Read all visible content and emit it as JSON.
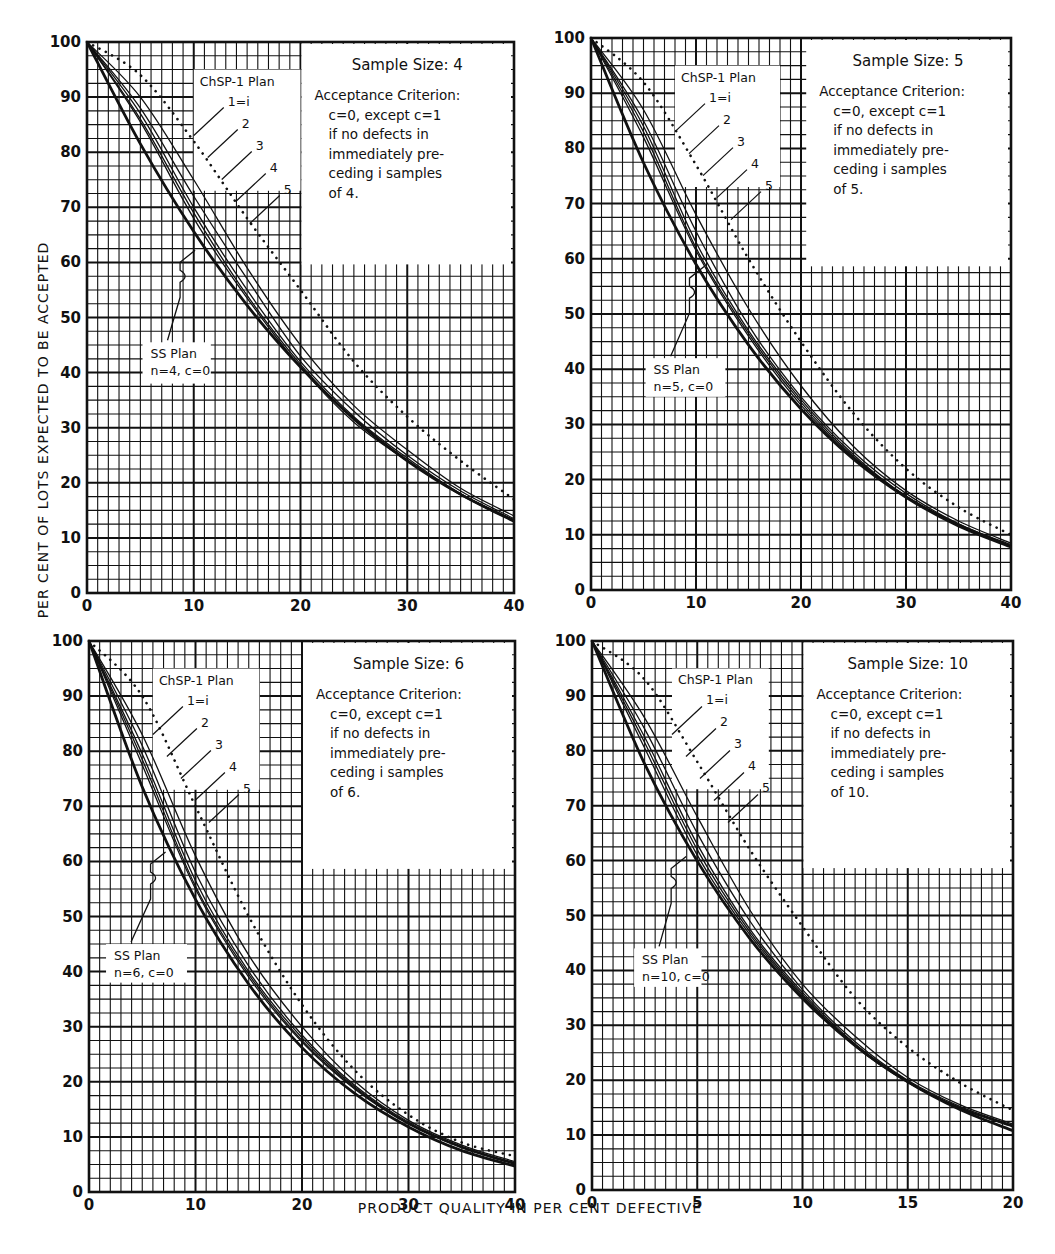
{
  "figure": {
    "ylabel": "PER CENT OF LOTS EXPECTED TO BE ACCEPTED",
    "xlabel": "PRODUCT QUALITY IN PER CENT DEFECTIVE",
    "colors": {
      "ink": "#111111",
      "paper": "#ffffff",
      "grid": "#1a1a1a"
    }
  },
  "chart_data": [
    {
      "type": "line",
      "title": "Sample Size: 4",
      "annotation_lines": [
        "Acceptance Criterion:",
        "c=0, except c=1",
        "if no defects in",
        "immediately pre-",
        "ceding i samples",
        "of 4."
      ],
      "legend_title": "ChSP-1 Plan",
      "legend_labels": [
        "1=i",
        "2",
        "3",
        "4",
        "5"
      ],
      "ss_label": [
        "SS Plan",
        "n=4, c=0"
      ],
      "xlabel": "PRODUCT QUALITY IN PER CENT DEFECTIVE",
      "ylabel": "PER CENT OF LOTS EXPECTED TO BE ACCEPTED",
      "xlim": [
        0,
        40
      ],
      "ylim": [
        0,
        100
      ],
      "xticks": [
        0,
        10,
        20,
        30,
        40
      ],
      "yticks": [
        0,
        10,
        20,
        30,
        40,
        50,
        60,
        70,
        80,
        90,
        100
      ],
      "grid": true,
      "x": [
        0,
        5,
        10,
        15,
        20,
        25,
        30,
        35,
        40
      ],
      "series": [
        {
          "name": "Upper bound (dotted)",
          "style": "dotted",
          "values": [
            100,
            94,
            82,
            68,
            55,
            42,
            32,
            24,
            17
          ]
        },
        {
          "name": "ChSP-1 i=1",
          "style": "thin",
          "values": [
            100,
            90,
            75,
            59,
            45,
            34,
            26,
            19,
            14
          ]
        },
        {
          "name": "ChSP-1 i=2",
          "style": "thin",
          "values": [
            100,
            88,
            72,
            57,
            43,
            33,
            25,
            18.5,
            13.5
          ]
        },
        {
          "name": "ChSP-1 i=3",
          "style": "thin",
          "values": [
            100,
            87,
            70,
            55,
            42,
            32,
            24.5,
            18,
            13.3
          ]
        },
        {
          "name": "ChSP-1 i=4",
          "style": "thin",
          "values": [
            100,
            86,
            69,
            54,
            41.5,
            31.5,
            24,
            18,
            13.2
          ]
        },
        {
          "name": "ChSP-1 i=5",
          "style": "thin",
          "values": [
            100,
            85.5,
            68,
            53.5,
            41,
            31,
            24,
            17.8,
            13
          ]
        },
        {
          "name": "SS Plan n=4, c=0",
          "style": "bold",
          "values": [
            100,
            81.5,
            65.6,
            52.2,
            41,
            31.6,
            24,
            17.9,
            13
          ]
        }
      ]
    },
    {
      "type": "line",
      "title": "Sample Size: 5",
      "annotation_lines": [
        "Acceptance Criterion:",
        "c=0, except c=1",
        "if no defects in",
        "immediately pre-",
        "ceding i samples",
        "of 5."
      ],
      "legend_title": "ChSP-1 Plan",
      "legend_labels": [
        "1=i",
        "2",
        "3",
        "4",
        "5"
      ],
      "ss_label": [
        "SS Plan",
        "n=5, c=0"
      ],
      "xlabel": "PRODUCT QUALITY IN PER CENT DEFECTIVE",
      "ylabel": "PER CENT OF LOTS EXPECTED TO BE ACCEPTED",
      "xlim": [
        0,
        40
      ],
      "ylim": [
        0,
        100
      ],
      "xticks": [
        0,
        10,
        20,
        30,
        40
      ],
      "yticks": [
        0,
        10,
        20,
        30,
        40,
        50,
        60,
        70,
        80,
        90,
        100
      ],
      "grid": true,
      "x": [
        0,
        5,
        10,
        15,
        20,
        25,
        30,
        35,
        40
      ],
      "series": [
        {
          "name": "Upper bound (dotted)",
          "style": "dotted",
          "values": [
            100,
            92,
            77,
            60,
            45,
            32,
            22,
            15,
            10
          ]
        },
        {
          "name": "ChSP-1 i=1",
          "style": "thin",
          "values": [
            100,
            87,
            68,
            51,
            37,
            26,
            18,
            12.5,
            8.5
          ]
        },
        {
          "name": "ChSP-1 i=2",
          "style": "thin",
          "values": [
            100,
            85,
            65,
            48,
            35,
            25,
            17.5,
            12,
            8.2
          ]
        },
        {
          "name": "ChSP-1 i=3",
          "style": "thin",
          "values": [
            100,
            84,
            63,
            47,
            34.5,
            24.5,
            17,
            12,
            8
          ]
        },
        {
          "name": "ChSP-1 i=4",
          "style": "thin",
          "values": [
            100,
            83,
            62,
            46.5,
            34,
            24.2,
            17,
            11.8,
            8
          ]
        },
        {
          "name": "ChSP-1 i=5",
          "style": "thin",
          "values": [
            100,
            82,
            61.5,
            46,
            33.5,
            24,
            16.9,
            11.7,
            7.9
          ]
        },
        {
          "name": "SS Plan n=5, c=0",
          "style": "bold",
          "values": [
            100,
            77.4,
            59,
            44.4,
            32.8,
            23.7,
            16.8,
            11.6,
            7.8
          ]
        }
      ]
    },
    {
      "type": "line",
      "title": "Sample Size: 6",
      "annotation_lines": [
        "Acceptance Criterion:",
        "c=0, except c=1",
        "if no defects in",
        "immediately pre-",
        "ceding i samples",
        "of 6."
      ],
      "legend_title": "ChSP-1 Plan",
      "legend_labels": [
        "1=i",
        "2",
        "3",
        "4",
        "5"
      ],
      "ss_label": [
        "SS Plan",
        "n=6, c=0"
      ],
      "xlabel": "PRODUCT QUALITY IN PER CENT DEFECTIVE",
      "ylabel": "PER CENT OF LOTS EXPECTED TO BE ACCEPTED",
      "xlim": [
        0,
        40
      ],
      "ylim": [
        0,
        100
      ],
      "xticks": [
        0,
        10,
        20,
        30,
        40
      ],
      "yticks": [
        0,
        10,
        20,
        30,
        40,
        50,
        60,
        70,
        80,
        90,
        100
      ],
      "grid": true,
      "x": [
        0,
        5,
        10,
        15,
        20,
        25,
        30,
        35,
        40
      ],
      "series": [
        {
          "name": "Upper bound (dotted)",
          "style": "dotted",
          "values": [
            100,
            90,
            70,
            50,
            34,
            22,
            14,
            9,
            6.5
          ]
        },
        {
          "name": "ChSP-1 i=1",
          "style": "thin",
          "values": [
            100,
            83,
            61,
            43,
            30,
            20,
            13,
            8.5,
            5.5
          ]
        },
        {
          "name": "ChSP-1 i=2",
          "style": "thin",
          "values": [
            100,
            81,
            58,
            41,
            28.5,
            19.3,
            12.7,
            8.3,
            5.3
          ]
        },
        {
          "name": "ChSP-1 i=3",
          "style": "thin",
          "values": [
            100,
            79.5,
            56.5,
            40,
            28,
            19,
            12.5,
            8.2,
            5.2
          ]
        },
        {
          "name": "ChSP-1 i=4",
          "style": "thin",
          "values": [
            100,
            78.5,
            55.5,
            39.5,
            27.5,
            18.8,
            12.4,
            8.1,
            5.1
          ]
        },
        {
          "name": "ChSP-1 i=5",
          "style": "thin",
          "values": [
            100,
            77.5,
            55,
            39,
            27.2,
            18.6,
            12.3,
            8,
            5
          ]
        },
        {
          "name": "SS Plan n=6, c=0",
          "style": "bold",
          "values": [
            100,
            73.5,
            53.1,
            37.7,
            26.2,
            17.8,
            11.8,
            7.5,
            4.7
          ]
        }
      ]
    },
    {
      "type": "line",
      "title": "Sample Size: 10",
      "annotation_lines": [
        "Acceptance Criterion:",
        "c=0, except c=1",
        "if no defects in",
        "immediately pre-",
        "ceding i samples",
        "of 10."
      ],
      "legend_title": "ChSP-1 Plan",
      "legend_labels": [
        "1=i",
        "2",
        "3",
        "4",
        "5"
      ],
      "ss_label": [
        "SS Plan",
        "n=10, c=0"
      ],
      "xlabel": "PRODUCT QUALITY IN PER CENT DEFECTIVE",
      "ylabel": "PER CENT OF LOTS EXPECTED TO BE ACCEPTED",
      "xlim": [
        0,
        20
      ],
      "ylim": [
        0,
        100
      ],
      "xticks": [
        0,
        5,
        10,
        15,
        20
      ],
      "yticks": [
        0,
        10,
        20,
        30,
        40,
        50,
        60,
        70,
        80,
        90,
        100
      ],
      "grid": true,
      "x": [
        0,
        2.5,
        5,
        7.5,
        10,
        12.5,
        15,
        17.5,
        20
      ],
      "series": [
        {
          "name": "Upper bound (dotted)",
          "style": "dotted",
          "values": [
            100,
            93,
            78,
            62,
            48,
            35,
            26,
            19.5,
            14.5
          ]
        },
        {
          "name": "ChSP-1 i=1",
          "style": "thin",
          "values": [
            100,
            86,
            68,
            51,
            37.5,
            28,
            20.5,
            15.5,
            12
          ]
        },
        {
          "name": "ChSP-1 i=2",
          "style": "thin",
          "values": [
            100,
            84,
            65,
            49,
            36.5,
            27,
            20,
            15.2,
            11.8
          ]
        },
        {
          "name": "ChSP-1 i=3",
          "style": "thin",
          "values": [
            100,
            82.5,
            63,
            47.5,
            36,
            26.6,
            19.8,
            15,
            11.7
          ]
        },
        {
          "name": "ChSP-1 i=4",
          "style": "thin",
          "values": [
            100,
            81.5,
            62,
            47,
            35.6,
            26.4,
            19.7,
            14.9,
            11.6
          ]
        },
        {
          "name": "ChSP-1 i=5",
          "style": "thin",
          "values": [
            100,
            80.5,
            61,
            46.5,
            35.3,
            26.2,
            19.6,
            14.8,
            11.5
          ]
        },
        {
          "name": "SS Plan n=10, c=0",
          "style": "bold",
          "values": [
            100,
            77.6,
            59.9,
            45.8,
            34.9,
            26.3,
            19.7,
            14.6,
            10.8
          ]
        }
      ]
    }
  ],
  "panels": [
    {
      "frame": [
        87,
        42,
        514,
        593
      ],
      "box": [
        0.5,
        0.0,
        1.0,
        0.4
      ],
      "leg_box": [
        0.25,
        0.05,
        0.5,
        0.27
      ],
      "ss_box": [
        0.13,
        0.545,
        0.29,
        0.62
      ]
    },
    {
      "frame": [
        591,
        38,
        1011,
        590
      ],
      "box": [
        0.51,
        0.0,
        1.0,
        0.41
      ],
      "leg_box": [
        0.2,
        0.05,
        0.45,
        0.27
      ],
      "ss_box": [
        0.13,
        0.58,
        0.32,
        0.65
      ]
    },
    {
      "frame": [
        89,
        641,
        515,
        1192
      ],
      "box": [
        0.5,
        0.0,
        1.0,
        0.41
      ],
      "leg_box": [
        0.15,
        0.05,
        0.4,
        0.27
      ],
      "ss_box": [
        0.04,
        0.55,
        0.23,
        0.62
      ]
    },
    {
      "frame": [
        592,
        641,
        1013,
        1190
      ],
      "box": [
        0.5,
        0.0,
        1.0,
        0.41
      ],
      "leg_box": [
        0.19,
        0.05,
        0.42,
        0.27
      ],
      "ss_box": [
        0.1,
        0.56,
        0.26,
        0.63
      ]
    }
  ]
}
